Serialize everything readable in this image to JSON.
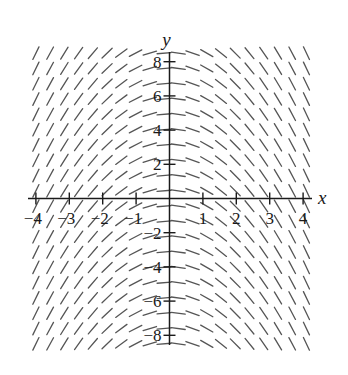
{
  "chart_data": {
    "type": "slope-field",
    "title": "",
    "equation": "dy/dx = -x",
    "xlabel": "x",
    "ylabel": "y",
    "xlim": [
      -4,
      4
    ],
    "ylim": [
      -8,
      8
    ],
    "x_ticks": [
      -4,
      -3,
      -2,
      -1,
      1,
      2,
      3,
      4
    ],
    "x_tick_labels": [
      "−4",
      "−3",
      "−2",
      "−1",
      "1",
      "2",
      "3",
      "4"
    ],
    "y_ticks": [
      -8,
      -6,
      -4,
      -2,
      2,
      4,
      6,
      8
    ],
    "y_tick_labels": [
      "−8",
      "−6",
      "−4",
      "−2",
      "2",
      "4",
      "6",
      "8"
    ],
    "grid": false,
    "field": {
      "x_range": [
        -4.0,
        4.1
      ],
      "y_range": [
        -8.5,
        8.5
      ],
      "columns": 20,
      "rows": 20,
      "segment_length_px": 14
    },
    "colors": {
      "axis": "#1a1a1a",
      "segments": "#555555",
      "background": "#ffffff"
    }
  }
}
